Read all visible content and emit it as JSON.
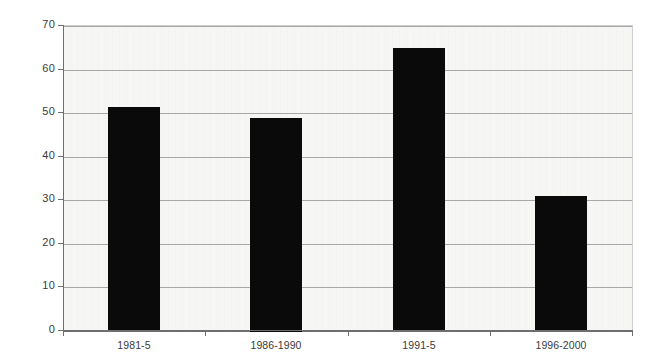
{
  "chart_data": {
    "type": "bar",
    "title": "",
    "subtitle": "",
    "xlabel": "",
    "ylabel": "",
    "categories": [
      "1981-5",
      "1986-1990",
      "1991-5",
      "1996-2000"
    ],
    "values": [
      51.5,
      49,
      65,
      31
    ],
    "series": [
      {
        "name": "",
        "values": [
          51.5,
          49,
          65,
          31
        ]
      }
    ],
    "ylim": [
      0,
      70
    ],
    "ytick_step": 10,
    "ytick_labels": [
      "70",
      "60",
      "50",
      "40",
      "30",
      "20",
      "10",
      "0"
    ],
    "ytick_values": [
      70,
      60,
      50,
      40,
      30,
      20,
      10,
      0
    ],
    "grid": "horizontal",
    "legend": "none",
    "bar_color": "#0a0a0a",
    "plot_background": "#f6f6f5",
    "gridline_color": "#a8a8a8",
    "axis_color": "#6e6e6e",
    "annotations": []
  }
}
